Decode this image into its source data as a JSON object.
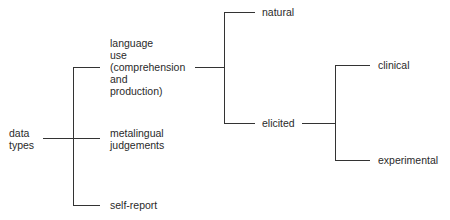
{
  "diagram": {
    "type": "tree",
    "root": {
      "label": "data\ntypes"
    },
    "level1": [
      {
        "label": "language\nuse\n(comprehension\nand\nproduction)"
      },
      {
        "label": "metalingual\njudgements"
      },
      {
        "label": "self-report"
      }
    ],
    "level2": [
      {
        "label": "natural"
      },
      {
        "label": "elicited"
      }
    ],
    "level3": [
      {
        "label": "clinical"
      },
      {
        "label": "experimental"
      }
    ],
    "line_color": "#333333"
  }
}
